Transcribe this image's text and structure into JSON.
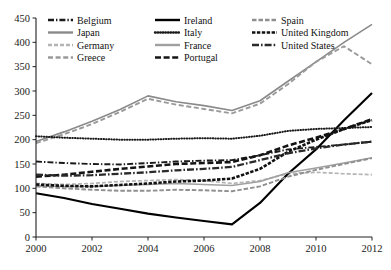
{
  "chart_data": {
    "type": "line",
    "title": "",
    "xlabel": "",
    "ylabel": "",
    "xlim": [
      2000,
      2012
    ],
    "ylim": [
      0,
      450
    ],
    "xticks": [
      "2000",
      "2002",
      "2004",
      "2006",
      "2008",
      "2010",
      "2012"
    ],
    "yticks": [
      "0",
      "50",
      "100",
      "150",
      "200",
      "250",
      "300",
      "350",
      "400",
      "450"
    ],
    "grid": false,
    "legend_position": "top-inside-left",
    "x": [
      2000,
      2001,
      2002,
      2003,
      2004,
      2005,
      2006,
      2007,
      2008,
      2009,
      2010,
      2011,
      2012
    ],
    "series": [
      {
        "name": "Belgium",
        "style": "dash-dot",
        "color": "#1a1a1a",
        "values": [
          155,
          152,
          150,
          149,
          152,
          155,
          157,
          158,
          168,
          180,
          185,
          190,
          196
        ]
      },
      {
        "name": "Japan",
        "style": "solid-gray",
        "color": "#8a8a8a",
        "values": [
          196,
          216,
          238,
          262,
          290,
          278,
          270,
          260,
          280,
          320,
          360,
          400,
          437
        ]
      },
      {
        "name": "Germany",
        "style": "dashed-light-gray",
        "color": "#b4b4b4",
        "values": [
          110,
          108,
          110,
          114,
          116,
          118,
          116,
          110,
          116,
          130,
          133,
          130,
          128
        ]
      },
      {
        "name": "Greece",
        "style": "dash-gray",
        "color": "#9a9a9a",
        "values": [
          193,
          211,
          232,
          257,
          284,
          272,
          263,
          254,
          274,
          314,
          360,
          392,
          355
        ]
      },
      {
        "name": "Ireland",
        "style": "solid-black",
        "color": "#000000",
        "values": [
          90,
          80,
          68,
          58,
          48,
          40,
          33,
          26,
          70,
          130,
          180,
          240,
          296
        ]
      },
      {
        "name": "Italy",
        "style": "dotted",
        "color": "#1a1a1a",
        "values": [
          207,
          204,
          202,
          200,
          200,
          202,
          203,
          202,
          208,
          218,
          222,
          224,
          226
        ]
      },
      {
        "name": "France",
        "style": "solid-midgray",
        "color": "#a0a0a0",
        "values": [
          105,
          104,
          104,
          106,
          108,
          110,
          108,
          106,
          114,
          132,
          142,
          152,
          163
        ]
      },
      {
        "name": "Portugal",
        "style": "heavy-dashed",
        "color": "#141414",
        "values": [
          124,
          128,
          134,
          140,
          145,
          150,
          152,
          154,
          168,
          188,
          204,
          222,
          242
        ]
      },
      {
        "name": "Spain",
        "style": "dashed-gray",
        "color": "#8f8f8f",
        "values": [
          104,
          100,
          97,
          95,
          95,
          97,
          96,
          94,
          104,
          124,
          138,
          150,
          162
        ]
      },
      {
        "name": "United Kingdom",
        "style": "thick-dashed-black",
        "color": "#111111",
        "values": [
          108,
          105,
          104,
          107,
          110,
          114,
          116,
          120,
          140,
          175,
          200,
          222,
          240
        ]
      },
      {
        "name": "United States",
        "style": "dash-dot-heavy",
        "color": "#2a2a2a",
        "values": [
          128,
          126,
          127,
          130,
          133,
          137,
          140,
          144,
          158,
          172,
          182,
          190,
          196
        ]
      }
    ]
  },
  "legend": {
    "columns": [
      [
        {
          "label": "Belgium",
          "swatch": "dash-dot"
        },
        {
          "label": "Japan",
          "swatch": "solid-gray"
        },
        {
          "label": "Germany",
          "swatch": "dashed-light-gray"
        },
        {
          "label": "Greece",
          "swatch": "dash-gray"
        }
      ],
      [
        {
          "label": "Ireland",
          "swatch": "solid-black"
        },
        {
          "label": "Italy",
          "swatch": "dotted"
        },
        {
          "label": "France",
          "swatch": "solid-midgray"
        },
        {
          "label": "Portugal",
          "swatch": "heavy-dashed"
        }
      ],
      [
        {
          "label": "Spain",
          "swatch": "dashed-gray"
        },
        {
          "label": "United Kingdom",
          "swatch": "thick-dashed-black"
        },
        {
          "label": "United States",
          "swatch": "dash-dot-heavy"
        }
      ]
    ]
  },
  "colors": {
    "axis": "#222222",
    "text": "#111111",
    "background": "#ffffff"
  }
}
